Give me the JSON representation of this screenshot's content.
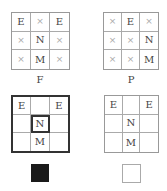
{
  "panels": [
    {
      "id": "F",
      "caption": "F",
      "cells": [
        "E",
        "×",
        "E",
        "×",
        "N",
        "×",
        "×",
        "M",
        "×"
      ]
    },
    {
      "id": "P",
      "caption": "P",
      "cells": [
        "×",
        "E",
        "×",
        "×",
        "×",
        "N",
        "×",
        "×",
        "M"
      ]
    },
    {
      "id": "bold-grid",
      "caption": "",
      "cells": [
        "E",
        "",
        "E",
        "",
        "N",
        "",
        "",
        "M",
        ""
      ],
      "highlighted_cell": 4,
      "swatch_color": "#1a1a1a"
    },
    {
      "id": "light-grid",
      "caption": "",
      "cells": [
        "E",
        "",
        "E",
        "",
        "N",
        "",
        "",
        "M",
        ""
      ],
      "swatch_color": "#ffffff"
    }
  ],
  "colors": {
    "mark": "#aaaaaa",
    "label": "#444444",
    "bold_border": "#333333",
    "filled_swatch": "#1a1a1a",
    "empty_swatch": "#ffffff"
  }
}
